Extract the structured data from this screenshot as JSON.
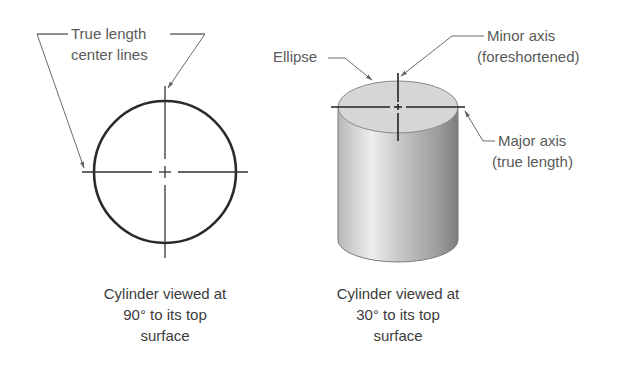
{
  "figure": {
    "left_view": {
      "callout": {
        "line1": "True length",
        "line2": "center lines"
      },
      "caption": {
        "line1": "Cylinder viewed at",
        "line2": "90° to its top",
        "line3": "surface"
      }
    },
    "right_view": {
      "callouts": {
        "ellipse": "Ellipse",
        "minor_axis": {
          "line1": "Minor axis",
          "line2": "(foreshortened)"
        },
        "major_axis": {
          "line1": "Major axis",
          "line2": "(true length)"
        }
      },
      "caption": {
        "line1": "Cylinder viewed at",
        "line2": "30° to its top",
        "line3": "surface"
      }
    },
    "colors": {
      "outline": "#2a2a2a",
      "leader": "#6a6a6a",
      "cylinder_light": "#ececec",
      "cylinder_dark": "#8a8a8a",
      "top_face": "#d4d4d4"
    }
  }
}
